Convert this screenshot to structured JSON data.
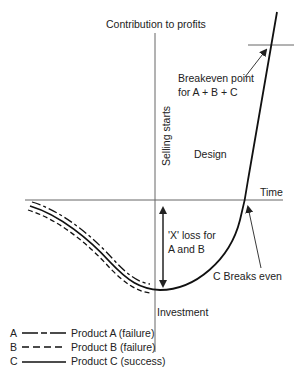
{
  "diagram": {
    "y_axis_label": "Contribution to profits",
    "x_axis_label": "Time",
    "vertical_marker_label": "Selling starts",
    "bottom_axis_label": "Investment",
    "region_label": "Design",
    "annotations": {
      "breakeven_all": [
        "Breakeven point",
        "for A + B + C"
      ],
      "loss_label": [
        "'X' loss for",
        "A and B"
      ],
      "c_breakeven": "C Breaks even"
    },
    "legend": [
      {
        "key": "A",
        "style": "dash-dot (long-short)",
        "label": "Product A (failure)"
      },
      {
        "key": "B",
        "style": "dashed",
        "label": "Product B (failure)"
      },
      {
        "key": "C",
        "style": "solid",
        "label": "Product C (success)"
      }
    ],
    "colors": {
      "line": "#222222",
      "axis": "#555555",
      "background": "#ffffff"
    }
  }
}
